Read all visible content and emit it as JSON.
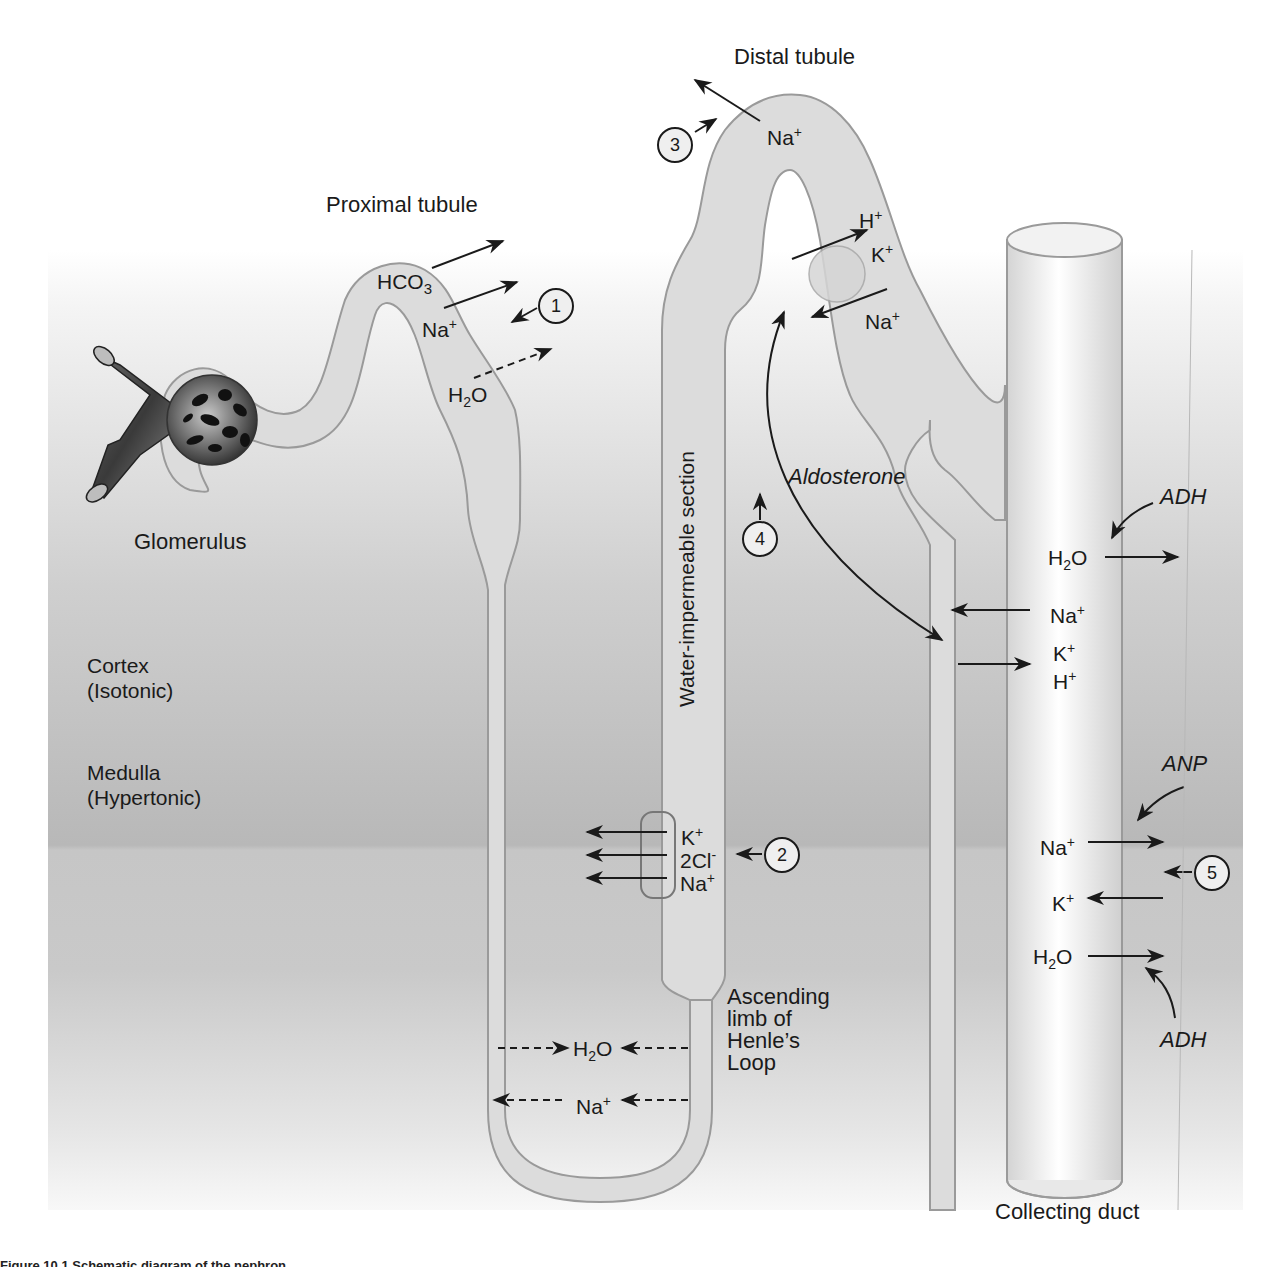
{
  "figure": {
    "titles": {
      "proximal": "Proximal tubule",
      "distal": "Distal tubule",
      "glomerulus": "Glomerulus",
      "collecting": "Collecting duct",
      "water_impermeable": "Water-impermeable section",
      "ascending_line1": "Ascending",
      "ascending_line2": "limb of",
      "ascending_line3": "Henle’s",
      "ascending_line4": "Loop"
    },
    "zones": {
      "cortex_line1": "Cortex",
      "cortex_line2": "(Isotonic)",
      "medulla_line1": "Medulla",
      "medulla_line2": "(Hypertonic)"
    },
    "hormones": {
      "aldosterone": "Aldosterone",
      "adh_top": "ADH",
      "anp": "ANP",
      "adh_bottom": "ADH"
    },
    "ions": {
      "prox_hco3": "HCO",
      "prox_hco3_sub": "3",
      "prox_na": "Na",
      "prox_h2o": "H",
      "prox_h2o_sub": "2",
      "prox_h2o_o": "O",
      "distal_na": "Na",
      "distal_h": "H",
      "distal_k": "K",
      "distal_na2": "Na",
      "loop_k": "K",
      "loop_cl": "2Cl",
      "loop_na": "Na",
      "desc_h2o": "H",
      "desc_h2o_sub": "2",
      "desc_h2o_o": "O",
      "desc_na": "Na",
      "cd_h2o": "H",
      "cd_h2o_sub": "2",
      "cd_h2o_o": "O",
      "cd_na": "Na",
      "cd_k": "K",
      "cd_h": "H",
      "cd2_na": "Na",
      "cd2_k": "K",
      "cd2_h2o": "H",
      "cd2_h2o_sub": "2",
      "cd2_h2o_o": "O",
      "plus": "+",
      "minus": "-"
    },
    "markers": [
      "1",
      "2",
      "3",
      "4",
      "5"
    ],
    "colors": {
      "tubule_fill": "#dcdcdc",
      "tubule_stroke": "#9a9a9a",
      "cortex_bg": "#bdbdbd",
      "medulla_bg": "#c4c4c4",
      "arrow": "#1a1a1a"
    },
    "caption_partial": "Figure 10.1 Schematic diagram of the nephron..."
  }
}
